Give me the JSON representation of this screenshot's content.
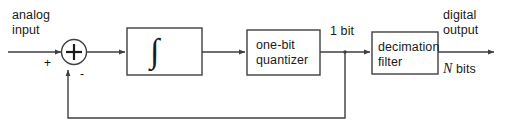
{
  "diagram": {
    "stroke_color": "#3f3f3f",
    "text_color": "#1a1a1a",
    "background": "#ffffff",
    "labels": {
      "analog_input_line1": "analog",
      "analog_input_line2": "input",
      "digital_output_line1": "digital",
      "digital_output_line2": "output",
      "plus_sign": "+",
      "minus_sign": "-",
      "one_bit": "1 bit",
      "n_bits_symbol": "N",
      "n_bits_unit": " bits",
      "summing_node": "+"
    },
    "blocks": [
      {
        "name": "integrator",
        "line1": "∫",
        "line2": ""
      },
      {
        "name": "quantizer",
        "line1": "one-bit",
        "line2": "quantizer"
      },
      {
        "name": "decimation-filter",
        "line1": "decimation",
        "line2": "filter"
      }
    ]
  }
}
